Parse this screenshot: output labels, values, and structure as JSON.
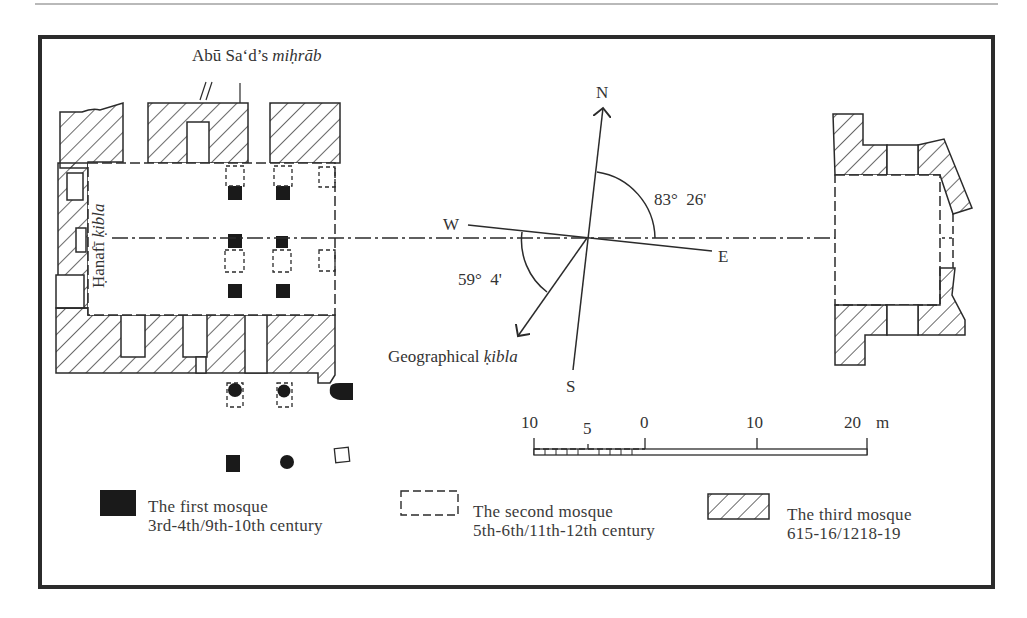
{
  "figure": {
    "labels": {
      "mihrab_prefix": "Abū Sa‘d’s",
      "mihrab_italic": "miḥrāb",
      "hanafi_prefix": "Ḥanafī",
      "hanafi_italic": "ḳibla",
      "geo_prefix": "Geographical",
      "geo_italic": "ḳibla"
    },
    "compass": {
      "north": "N",
      "south": "S",
      "east": "E",
      "west": "W",
      "angle_north_east": "83°  26'",
      "angle_west_kibla": "59°  4'"
    },
    "scale_bar": {
      "ticks": [
        "10",
        "5",
        "0",
        "10",
        "20"
      ],
      "unit": "m"
    },
    "legend": [
      {
        "symbol": "solid-black",
        "title": "The first mosque",
        "period": "3rd-4th/9th-10th century"
      },
      {
        "symbol": "dashed-outline",
        "title": "The second mosque",
        "period": "5th-6th/11th-12th century"
      },
      {
        "symbol": "hatched",
        "title": "The third mosque",
        "period": "615-16/1218-19"
      }
    ],
    "colors": {
      "ink": "#2b2b2b",
      "background": "#ffffff",
      "rule": "#b9b9b9"
    }
  }
}
